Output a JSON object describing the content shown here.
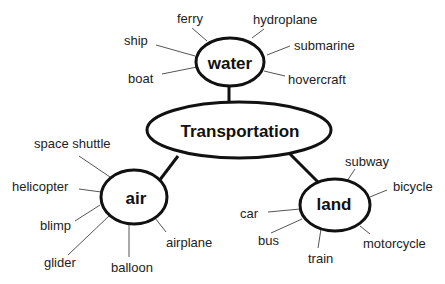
{
  "diagram": {
    "type": "concept-map",
    "center": {
      "id": "transportation",
      "label": "Transportation"
    },
    "categories": [
      {
        "id": "water",
        "label": "water",
        "items": [
          "ferry",
          "hydroplane",
          "ship",
          "submarine",
          "boat",
          "hovercraft"
        ]
      },
      {
        "id": "air",
        "label": "air",
        "items": [
          "space shuttle",
          "helicopter",
          "blimp",
          "glider",
          "balloon",
          "airplane"
        ]
      },
      {
        "id": "land",
        "label": "land",
        "items": [
          "subway",
          "bicycle",
          "car",
          "bus",
          "train",
          "motorcycle"
        ]
      }
    ]
  }
}
